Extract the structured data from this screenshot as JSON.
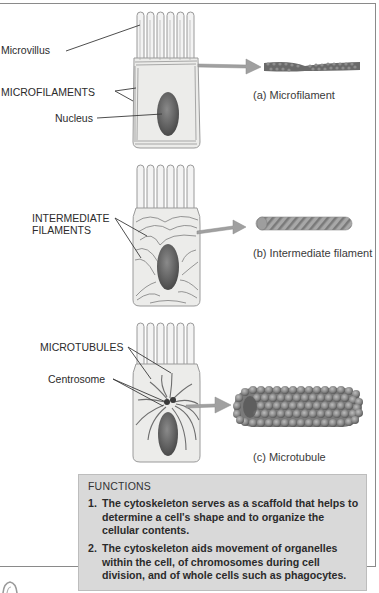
{
  "figure": {
    "panels": [
      {
        "id": "a",
        "caption": "(a) Microfilament",
        "labels": [
          "Microvillus",
          "MICROFILAMENTS",
          "Nucleus"
        ]
      },
      {
        "id": "b",
        "caption": "(b) Intermediate filament",
        "labels": [
          "INTERMEDIATE",
          "FILAMENTS"
        ]
      },
      {
        "id": "c",
        "caption": "(c) Microtubule",
        "labels": [
          "MICROTUBULES",
          "Centrosome"
        ]
      }
    ],
    "functions": {
      "title": "FUNCTIONS",
      "items": [
        {
          "num": "1.",
          "text": "The cytoskeleton serves as a scaffold that helps to determine a cell's shape and to organize the cellular contents."
        },
        {
          "num": "2.",
          "text": "The cytoskeleton aids movement of organelles within the cell, of chromosomes during cell division, and of whole cells such as phagocytes."
        }
      ]
    },
    "colors": {
      "cell_fill": "#ececea",
      "cell_outline": "#9a9a9a",
      "nucleus": "#6e6e6e",
      "filament": "#6a6a6a",
      "arrow": "#9c9c9c",
      "functions_bg": "#d9d9d9"
    }
  }
}
